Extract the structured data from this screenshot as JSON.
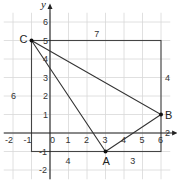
{
  "diagram": {
    "type": "coordinate-grid-triangle",
    "axes": {
      "x_label": "x",
      "y_label": "y",
      "x_ticks": [
        "-2",
        "-1",
        "0",
        "1",
        "2",
        "3",
        "4",
        "5",
        "6"
      ],
      "y_ticks": [
        "-2",
        "-1",
        "1",
        "2",
        "3",
        "4",
        "5",
        "6"
      ],
      "x_range": [
        -2,
        6
      ],
      "y_range": [
        -2,
        6
      ]
    },
    "points": [
      {
        "name": "A",
        "x": 3,
        "y": -1
      },
      {
        "name": "B",
        "x": 6,
        "y": 1
      },
      {
        "name": "C",
        "x": -1,
        "y": 5
      }
    ],
    "bounding_rectangle": {
      "x_min": -1,
      "x_max": 6,
      "y_min": -1,
      "y_max": 5
    },
    "dimension_labels": {
      "top": "7",
      "right": "4",
      "left": "6",
      "bottom_left": "4",
      "bottom_right": "3",
      "right_lower": "2"
    },
    "colors": {
      "grid": "#d8d8d8",
      "lines": "#333333",
      "background": "#ffffff"
    }
  }
}
